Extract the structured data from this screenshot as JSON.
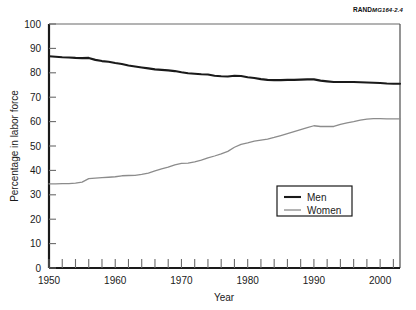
{
  "source_note": {
    "brand": "RAND",
    "number": "MG164-2.4"
  },
  "chart_data": {
    "type": "line",
    "title": "",
    "xlabel": "Year",
    "ylabel": "Percentage in labor force",
    "xlim": [
      1950,
      2003
    ],
    "ylim": [
      0,
      100
    ],
    "grid": false,
    "legend_position": "center-right",
    "y_ticks": [
      0,
      10,
      20,
      30,
      40,
      50,
      60,
      70,
      80,
      90,
      100
    ],
    "x_ticks_labeled": [
      1950,
      1960,
      1970,
      1980,
      1990,
      2000
    ],
    "x_minor_tick_interval": 2,
    "x": [
      1950,
      1951,
      1952,
      1953,
      1954,
      1955,
      1956,
      1957,
      1958,
      1959,
      1960,
      1961,
      1962,
      1963,
      1964,
      1965,
      1966,
      1967,
      1968,
      1969,
      1970,
      1971,
      1972,
      1973,
      1974,
      1975,
      1976,
      1977,
      1978,
      1979,
      1980,
      1981,
      1982,
      1983,
      1984,
      1985,
      1986,
      1987,
      1988,
      1989,
      1990,
      1991,
      1992,
      1993,
      1994,
      1995,
      1996,
      1997,
      1998,
      1999,
      2000,
      2001,
      2002,
      2003
    ],
    "series": [
      {
        "name": "Men",
        "color": "#1a1a1a",
        "width": 2.1,
        "values": [
          86.8,
          86.6,
          86.4,
          86.3,
          86.1,
          86.0,
          86.1,
          85.3,
          84.8,
          84.5,
          84.0,
          83.6,
          83.0,
          82.6,
          82.2,
          81.8,
          81.4,
          81.2,
          81.0,
          80.7,
          80.2,
          79.8,
          79.6,
          79.4,
          79.3,
          78.8,
          78.6,
          78.5,
          78.8,
          78.7,
          78.2,
          77.9,
          77.4,
          77.1,
          77.0,
          77.0,
          77.1,
          77.1,
          77.2,
          77.3,
          77.3,
          76.8,
          76.5,
          76.2,
          76.2,
          76.2,
          76.2,
          76.1,
          76.0,
          75.9,
          75.8,
          75.6,
          75.5,
          75.5
        ]
      },
      {
        "name": "Women",
        "color": "#8c8c8c",
        "width": 1.3,
        "values": [
          34.5,
          34.5,
          34.6,
          34.6,
          34.8,
          35.2,
          36.6,
          36.8,
          37.0,
          37.2,
          37.4,
          37.8,
          37.9,
          38.0,
          38.4,
          38.9,
          39.8,
          40.6,
          41.3,
          42.3,
          42.9,
          43.0,
          43.5,
          44.2,
          45.1,
          45.9,
          46.8,
          47.8,
          49.5,
          50.7,
          51.3,
          52.0,
          52.4,
          52.8,
          53.5,
          54.3,
          55.1,
          55.9,
          56.7,
          57.5,
          58.3,
          58.0,
          58.0,
          58.0,
          58.9,
          59.5,
          60.0,
          60.6,
          61.0,
          61.2,
          61.2,
          61.1,
          61.1,
          61.1
        ]
      }
    ]
  }
}
